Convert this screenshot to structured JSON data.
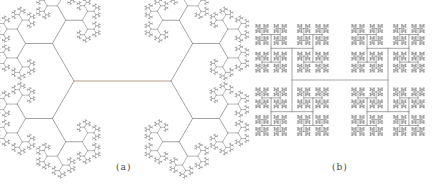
{
  "figures": [
    {
      "id": "a",
      "caption": "(a)",
      "caption_pos": [
        116,
        162
      ],
      "type": "fractal-tree",
      "trunk": {
        "x1": 74,
        "y1": 81,
        "x2": 171,
        "y2": 81
      },
      "angle_deg": 60,
      "ratio": 0.62,
      "depth": 9,
      "color": "#9a9a9a",
      "trunk_color": "#b89a8a"
    },
    {
      "id": "b",
      "caption": "(b)",
      "caption_pos": [
        332,
        162
      ],
      "type": "h-tree",
      "trunk": {
        "x1": 292,
        "y1": 80,
        "x2": 388,
        "y2": 80
      },
      "angle_deg": 90,
      "ratio": 0.66,
      "depth": 10,
      "color": "#9a9a9a",
      "trunk_color": "#a8a8a8"
    }
  ]
}
